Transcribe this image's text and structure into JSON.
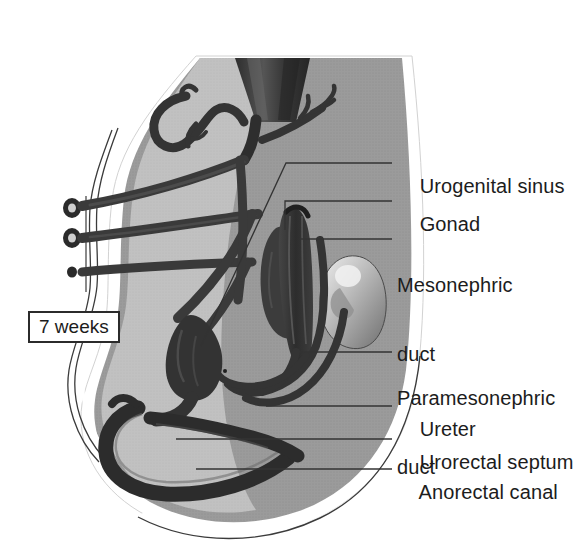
{
  "figure": {
    "stage_badge": "7 weeks",
    "palette": {
      "background": "#ffffff",
      "body_fill": "#9b9b9b",
      "body_fill_light": "#c9c9c9",
      "duct_dark": "#3a3a3a",
      "duct_darkest": "#262626",
      "kidney_light": "#d8d8d8",
      "outline": "#2b2b2b",
      "text": "#1c1c1c",
      "leader_line": "#333333"
    },
    "labels": [
      {
        "id": "urogenital-sinus",
        "text": "Urogenital sinus",
        "x": 397,
        "y": 152,
        "leader": "diagonal"
      },
      {
        "id": "gonad",
        "text": "Gonad",
        "x": 397,
        "y": 190,
        "leader": "elbow"
      },
      {
        "id": "mesonephric-duct",
        "text": "Mesonephric",
        "text2": "duct",
        "x": 397,
        "y": 228,
        "leader": "horizontal"
      },
      {
        "id": "paramesonephric-duct",
        "text": "Paramesonephric",
        "text2": "duct",
        "x": 397,
        "y": 341,
        "leader": "horizontal"
      },
      {
        "id": "ureter",
        "text": "Ureter",
        "x": 397,
        "y": 395,
        "leader": "horizontal"
      },
      {
        "id": "urorectal-septum",
        "text": "Urorectal septum",
        "x": 397,
        "y": 428,
        "leader": "horizontal"
      },
      {
        "id": "anorectal-canal",
        "text": "Anorectal canal",
        "x": 397,
        "y": 458,
        "leader": "horizontal"
      }
    ],
    "structures": [
      "body-silhouette",
      "aorta-stump",
      "umbilical-vessels",
      "vessel-cross-sections",
      "gonad",
      "mesonephros",
      "kidney",
      "mesonephric-duct",
      "paramesonephric-duct",
      "ureter",
      "urogenital-sinus",
      "urorectal-septum",
      "anorectal-canal"
    ]
  }
}
